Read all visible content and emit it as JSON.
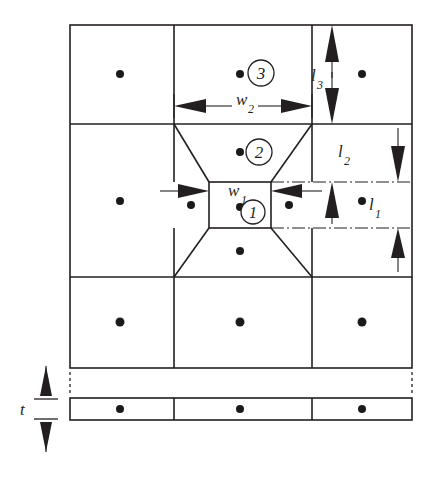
{
  "figure": {
    "background_color": "#ffffff",
    "line_color": "#231f20",
    "node_color": "#1a1a1a"
  },
  "labels": {
    "w1": "w",
    "w1_sub": "1",
    "w2": "w",
    "w2_sub": "2",
    "l1": "l",
    "l1_sub": "1",
    "l2": "l",
    "l2_sub": "2",
    "l3": "l",
    "l3_sub": "3",
    "t": "t"
  },
  "region_markers": [
    {
      "name": "region-1",
      "text": "1",
      "cx": 253,
      "cy": 212
    },
    {
      "name": "region-2",
      "text": "2",
      "cx": 259,
      "cy": 152
    },
    {
      "name": "region-3",
      "text": "3",
      "cx": 261,
      "cy": 73
    }
  ],
  "dimensions": [
    {
      "name": "w1",
      "orientation": "horizontal",
      "arrow_style": "inward",
      "label": "w",
      "subscript": "1"
    },
    {
      "name": "w2",
      "orientation": "horizontal",
      "arrow_style": "outward",
      "label": "w",
      "subscript": "2"
    },
    {
      "name": "l1",
      "orientation": "vertical",
      "arrow_style": "outward",
      "label": "l",
      "subscript": "1"
    },
    {
      "name": "l2",
      "orientation": "vertical",
      "arrow_style": "outward",
      "label": "l",
      "subscript": "2"
    },
    {
      "name": "l3",
      "orientation": "vertical",
      "arrow_style": "outward",
      "label": "l",
      "subscript": "3"
    },
    {
      "name": "t",
      "orientation": "vertical",
      "arrow_style": "outward",
      "label": "t",
      "subscript": ""
    }
  ],
  "grid": {
    "left": 70,
    "right": 412,
    "top": 25,
    "col_lines": [
      174,
      312
    ],
    "row_lines": [
      124,
      277,
      368
    ],
    "strip_top": 398,
    "strip_bottom": 420
  },
  "nodes": [
    {
      "cx": 120,
      "cy": 74
    },
    {
      "cx": 240,
      "cy": 74
    },
    {
      "cx": 362,
      "cy": 74
    },
    {
      "cx": 120,
      "cy": 201
    },
    {
      "cx": 240,
      "cy": 152
    },
    {
      "cx": 362,
      "cy": 201
    },
    {
      "cx": 191,
      "cy": 205
    },
    {
      "cx": 289,
      "cy": 205
    },
    {
      "cx": 240,
      "cy": 207
    },
    {
      "cx": 240,
      "cy": 251
    },
    {
      "cx": 120,
      "cy": 322
    },
    {
      "cx": 240,
      "cy": 322
    },
    {
      "cx": 362,
      "cy": 322
    },
    {
      "cx": 120,
      "cy": 409
    },
    {
      "cx": 240,
      "cy": 409
    },
    {
      "cx": 362,
      "cy": 409
    }
  ]
}
